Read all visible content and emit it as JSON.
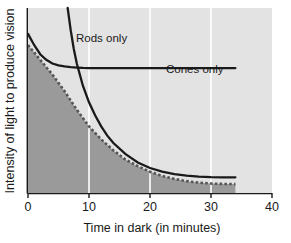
{
  "chart_data": {
    "type": "line",
    "title": "",
    "xlabel": "Time in dark (in minutes)",
    "ylabel": "Intensity of light to produce vision",
    "xlim": [
      0,
      40
    ],
    "ylim": [
      0,
      100
    ],
    "xticks": [
      0,
      10,
      20,
      30,
      40
    ],
    "xticklabels": [
      "0",
      "10",
      "20",
      "30",
      "40"
    ],
    "yticks": [],
    "yticklabels": [],
    "grid": "vertical-white-gridlines-at-10-20-30",
    "legend_position": "inline-annotations",
    "plot_bg_color": "#e3e3e3",
    "shaded_region_color": "#9a9a9a",
    "gridline_color": "#ffffff",
    "line_color": "#1a1a1a",
    "dotted_line_color": "#555555",
    "annotations": [
      {
        "name": "rods-only",
        "text": "Rods only",
        "x": 10.5,
        "y": 82
      },
      {
        "name": "cones-only",
        "text": "Cones only",
        "x": 27.5,
        "y": 64
      }
    ],
    "series": [
      {
        "name": "Rods only",
        "style": "solid",
        "description": "Steep descending curve entering from top of plot at about 6.5 minutes, crossing the cones line near 8 minutes, decaying toward a low plateau by 30 minutes.",
        "x": [
          6.5,
          7,
          7.5,
          8,
          9,
          10,
          11,
          12,
          13,
          14,
          16,
          18,
          20,
          22,
          24,
          26,
          28,
          30,
          32,
          34
        ],
        "y": [
          100,
          88,
          78,
          70,
          58,
          49,
          42,
          36,
          31,
          27,
          21,
          16.5,
          13.5,
          11.5,
          10.2,
          9.4,
          8.9,
          8.6,
          8.5,
          8.5
        ]
      },
      {
        "name": "Cones only",
        "style": "solid",
        "description": "Curve starting high at time zero, falling quickly and flattening into a long horizontal plateau from about 9 minutes to 34 minutes.",
        "x": [
          0,
          1,
          2,
          3,
          4,
          5,
          6,
          7,
          8,
          9,
          10,
          14,
          18,
          22,
          26,
          30,
          34
        ],
        "y": [
          86,
          80,
          75,
          72,
          70,
          69,
          68.4,
          68,
          67.8,
          67.6,
          67.5,
          67.5,
          67.5,
          67.5,
          67.5,
          67.5,
          67.5
        ]
      },
      {
        "name": "Shaded region boundary",
        "style": "dotted",
        "description": "Dotted curve bounding the top of the dark shaded area, running just below the upper solid curve and flattening near 34 minutes.",
        "x": [
          0,
          2,
          4,
          6,
          8,
          10,
          12,
          14,
          16,
          18,
          20,
          22,
          24,
          26,
          28,
          30,
          32,
          34
        ],
        "y": [
          80,
          72,
          64,
          55,
          45,
          36,
          29,
          23,
          18,
          14.5,
          11.5,
          9.2,
          7.6,
          6.4,
          5.6,
          5.1,
          4.9,
          4.8
        ]
      }
    ],
    "shaded_region_end_x": 34
  },
  "axis": {
    "x_title": "Time in dark (in minutes)",
    "y_title": "Intensity of light to produce vision",
    "x_tick_0": "0",
    "x_tick_10": "10",
    "x_tick_20": "20",
    "x_tick_30": "30",
    "x_tick_40": "40"
  },
  "labels": {
    "rods_only": "Rods only",
    "cones_only": "Cones only"
  }
}
